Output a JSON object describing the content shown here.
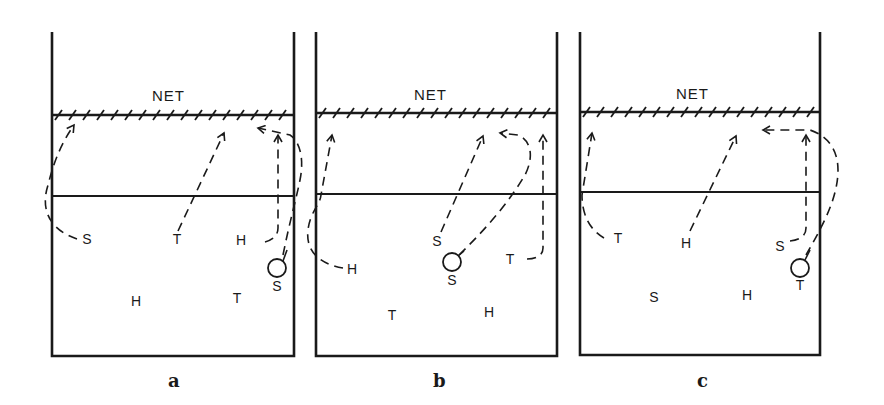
{
  "figure": {
    "panels": [
      {
        "id": "a",
        "caption": "a",
        "net_label": "NET",
        "players": [
          {
            "label": "S",
            "x": 87,
            "y": 244
          },
          {
            "label": "T",
            "x": 177,
            "y": 244
          },
          {
            "label": "H",
            "x": 241,
            "y": 245
          },
          {
            "label": "S",
            "x": 277,
            "y": 291
          },
          {
            "label": "H",
            "x": 136,
            "y": 306
          },
          {
            "label": "T",
            "x": 237,
            "y": 303
          }
        ],
        "ball": {
          "x": 277,
          "y": 268
        }
      },
      {
        "id": "b",
        "caption": "b",
        "net_label": "NET",
        "players": [
          {
            "label": "H",
            "x": 352,
            "y": 274
          },
          {
            "label": "S",
            "x": 437,
            "y": 246
          },
          {
            "label": "S",
            "x": 452,
            "y": 285
          },
          {
            "label": "T",
            "x": 510,
            "y": 264
          },
          {
            "label": "T",
            "x": 392,
            "y": 320
          },
          {
            "label": "H",
            "x": 489,
            "y": 317
          }
        ],
        "ball": {
          "x": 452,
          "y": 262
        }
      },
      {
        "id": "c",
        "caption": "c",
        "net_label": "NET",
        "players": [
          {
            "label": "T",
            "x": 618,
            "y": 243
          },
          {
            "label": "H",
            "x": 686,
            "y": 248
          },
          {
            "label": "S",
            "x": 780,
            "y": 251
          },
          {
            "label": "T",
            "x": 800,
            "y": 290
          },
          {
            "label": "S",
            "x": 654,
            "y": 302
          },
          {
            "label": "H",
            "x": 747,
            "y": 300
          }
        ],
        "ball": {
          "x": 800,
          "y": 268
        }
      }
    ]
  }
}
